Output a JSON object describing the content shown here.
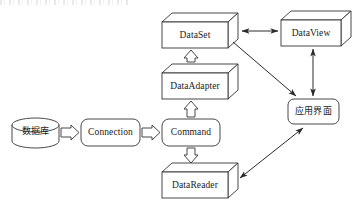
{
  "diagram": {
    "stroke_color": "#333333",
    "text_color": "#1a1a1a",
    "background_color": "#ffffff",
    "nodes": [
      {
        "id": "database",
        "label": "数据库",
        "shape": "cylinder",
        "x": 12,
        "y": 118,
        "w": 47,
        "h": 30
      },
      {
        "id": "connection",
        "label": "Connection",
        "shape": "rounded-rect",
        "x": 81,
        "y": 119,
        "w": 59,
        "h": 27
      },
      {
        "id": "command",
        "label": "Command",
        "shape": "rounded-rect",
        "x": 162,
        "y": 119,
        "w": 58,
        "h": 27
      },
      {
        "id": "dataset",
        "label": "DataSet",
        "shape": "cube-3d",
        "x": 162,
        "y": 22,
        "w": 66,
        "h": 26
      },
      {
        "id": "dataadapter",
        "label": "DataAdapter",
        "shape": "cube-3d",
        "x": 162,
        "y": 73,
        "w": 66,
        "h": 26
      },
      {
        "id": "datareader",
        "label": "DataReader",
        "shape": "cube-3d",
        "x": 162,
        "y": 172,
        "w": 66,
        "h": 26
      },
      {
        "id": "dataview",
        "label": "DataView",
        "shape": "cube-3d",
        "x": 281,
        "y": 20,
        "w": 60,
        "h": 26
      },
      {
        "id": "appui",
        "label": "应用界面",
        "shape": "rounded-rect",
        "x": 288,
        "y": 99,
        "w": 51,
        "h": 25
      }
    ],
    "edges": [
      {
        "id": "database-to-connection",
        "from": "database",
        "to": "connection",
        "style": "hollow-block-arrow",
        "direction": "right"
      },
      {
        "id": "connection-to-command",
        "from": "connection",
        "to": "command",
        "style": "hollow-block-arrow",
        "direction": "right"
      },
      {
        "id": "command-to-dataadapter",
        "from": "command",
        "to": "dataadapter",
        "style": "hollow-block-arrow",
        "direction": "up"
      },
      {
        "id": "dataadapter-to-dataset",
        "from": "dataadapter",
        "to": "dataset",
        "style": "hollow-block-arrow",
        "direction": "up"
      },
      {
        "id": "command-to-datareader",
        "from": "command",
        "to": "datareader",
        "style": "hollow-block-arrow",
        "direction": "down"
      },
      {
        "id": "dataset-to-dataview",
        "from": "dataset",
        "to": "dataview",
        "style": "line-double-arrow",
        "direction": "horizontal"
      },
      {
        "id": "dataview-to-appui",
        "from": "dataview",
        "to": "appui",
        "style": "line-double-arrow",
        "direction": "vertical"
      },
      {
        "id": "dataset-to-appui",
        "from": "dataset",
        "to": "appui",
        "style": "line-arrow",
        "direction": "diagonal-down-right"
      },
      {
        "id": "datareader-to-appui",
        "from": "datareader",
        "to": "appui",
        "style": "line-double-arrow",
        "direction": "diagonal"
      }
    ]
  }
}
